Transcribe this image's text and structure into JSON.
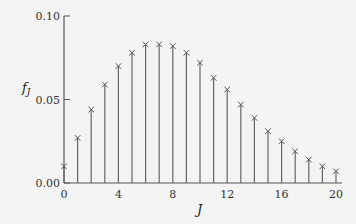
{
  "chart_data": {
    "type": "stem",
    "title": "",
    "xlabel": "J",
    "ylabel": "f_J",
    "xlim": [
      0,
      20
    ],
    "ylim": [
      0,
      0.1
    ],
    "xticks": [
      0,
      4,
      8,
      12,
      16,
      20
    ],
    "yticks": [
      0.0,
      0.05,
      0.1
    ],
    "ytick_labels": [
      "0.00",
      "0.05",
      "0.10"
    ],
    "x": [
      0,
      1,
      2,
      3,
      4,
      5,
      6,
      7,
      8,
      9,
      10,
      11,
      12,
      13,
      14,
      15,
      16,
      17,
      18,
      19,
      20
    ],
    "values": [
      0.01,
      0.027,
      0.044,
      0.059,
      0.07,
      0.078,
      0.083,
      0.083,
      0.082,
      0.078,
      0.072,
      0.063,
      0.056,
      0.047,
      0.039,
      0.031,
      0.025,
      0.019,
      0.014,
      0.01,
      0.007
    ],
    "marker": "x",
    "grid": false,
    "legend": null
  }
}
